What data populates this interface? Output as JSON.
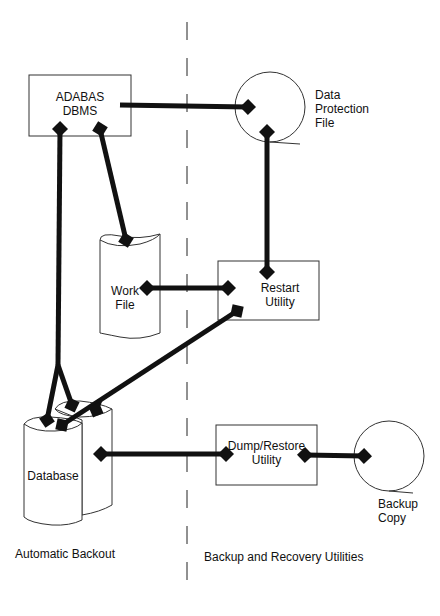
{
  "diagram": {
    "nodes": {
      "adabas": {
        "line1": "ADABAS",
        "line2": "DBMS"
      },
      "data_protection": {
        "line1": "Data",
        "line2": "Protection",
        "line3": "File"
      },
      "work_file": {
        "line1": "Work",
        "line2": "File"
      },
      "restart": {
        "line1": "Restart",
        "line2": "Utility"
      },
      "database": {
        "label": "Database"
      },
      "dump_restore": {
        "line1": "Dump/Restore",
        "line2": "Utility"
      },
      "backup_copy": {
        "line1": "Backup",
        "line2": "Copy"
      }
    },
    "sections": {
      "left": "Automatic Backout",
      "right": "Backup and Recovery Utilities"
    },
    "edges": [
      {
        "from": "ADABAS DBMS",
        "to": "Data Protection File"
      },
      {
        "from": "ADABAS DBMS",
        "to": "Work File"
      },
      {
        "from": "Database",
        "to": "ADABAS DBMS"
      },
      {
        "from": "Data Protection File",
        "to": "Restart Utility"
      },
      {
        "from": "Work File",
        "to": "Restart Utility"
      },
      {
        "from": "Restart Utility",
        "to": "Database"
      },
      {
        "from": "Database",
        "to": "Dump/Restore Utility"
      },
      {
        "from": "Dump/Restore Utility",
        "to": "Backup Copy"
      }
    ]
  }
}
